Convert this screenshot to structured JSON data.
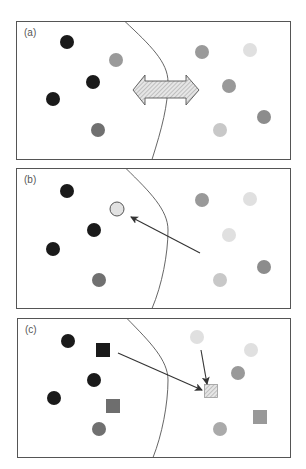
{
  "figure": {
    "panels": [
      {
        "label": "(a)",
        "description": "Two clusters separated by a curved decision boundary; a double-headed hatched arrow crosses the boundary",
        "points": [
          {
            "shape": "circle",
            "x": 67,
            "y": 42,
            "color": "#1a1a1a"
          },
          {
            "shape": "circle",
            "x": 116,
            "y": 60,
            "color": "#9a9a9a"
          },
          {
            "shape": "circle",
            "x": 93,
            "y": 82,
            "color": "#1a1a1a"
          },
          {
            "shape": "circle",
            "x": 53,
            "y": 99,
            "color": "#1a1a1a"
          },
          {
            "shape": "circle",
            "x": 98,
            "y": 130,
            "color": "#707070"
          },
          {
            "shape": "circle",
            "x": 202,
            "y": 52,
            "color": "#9a9a9a"
          },
          {
            "shape": "circle",
            "x": 250,
            "y": 50,
            "color": "#e0e0e0"
          },
          {
            "shape": "circle",
            "x": 229,
            "y": 86,
            "color": "#999999"
          },
          {
            "shape": "circle",
            "x": 264,
            "y": 117,
            "color": "#8c8c8c"
          },
          {
            "shape": "circle",
            "x": 220,
            "y": 130,
            "color": "#c8c8c8"
          }
        ]
      },
      {
        "label": "(b)",
        "description": "A point from the right cluster is moved across the boundary (arrow) to an outlined light circle",
        "points": [
          {
            "shape": "circle",
            "x": 67,
            "y": 191,
            "color": "#1a1a1a"
          },
          {
            "shape": "circle-outlined",
            "x": 117,
            "y": 209,
            "color": "#e2e2e2"
          },
          {
            "shape": "circle",
            "x": 94,
            "y": 230,
            "color": "#1a1a1a"
          },
          {
            "shape": "circle",
            "x": 53,
            "y": 249,
            "color": "#1a1a1a"
          },
          {
            "shape": "circle",
            "x": 99,
            "y": 280,
            "color": "#707070"
          },
          {
            "shape": "circle",
            "x": 202,
            "y": 200,
            "color": "#999999"
          },
          {
            "shape": "circle",
            "x": 250,
            "y": 199,
            "color": "#e0e0e0"
          },
          {
            "shape": "circle",
            "x": 229,
            "y": 235,
            "color": "#e0e0e0"
          },
          {
            "shape": "circle",
            "x": 264,
            "y": 267,
            "color": "#8c8c8c"
          },
          {
            "shape": "circle",
            "x": 220,
            "y": 280,
            "color": "#c8c8c8"
          }
        ]
      },
      {
        "label": "(c)",
        "description": "Squares are combined via two arrows into a hatched square on the right side",
        "points": [
          {
            "shape": "circle",
            "x": 68,
            "y": 341,
            "color": "#1a1a1a"
          },
          {
            "shape": "square",
            "x": 103,
            "y": 350,
            "color": "#1a1a1a"
          },
          {
            "shape": "circle",
            "x": 94,
            "y": 380,
            "color": "#1a1a1a"
          },
          {
            "shape": "circle",
            "x": 54,
            "y": 398,
            "color": "#1a1a1a"
          },
          {
            "shape": "square",
            "x": 113,
            "y": 406,
            "color": "#6e6e6e"
          },
          {
            "shape": "circle",
            "x": 99,
            "y": 429,
            "color": "#707070"
          },
          {
            "shape": "circle",
            "x": 197,
            "y": 337,
            "color": "#e0e0e0"
          },
          {
            "shape": "circle",
            "x": 251,
            "y": 350,
            "color": "#e0e0e0"
          },
          {
            "shape": "circle",
            "x": 238,
            "y": 373,
            "color": "#999999"
          },
          {
            "shape": "square-hatched",
            "x": 211,
            "y": 391,
            "color": "#e8e8e8"
          },
          {
            "shape": "square",
            "x": 260,
            "y": 417,
            "color": "#999999"
          },
          {
            "shape": "circle",
            "x": 220,
            "y": 429,
            "color": "#aaaaaa"
          }
        ]
      }
    ],
    "colors": {
      "frame": "#555555",
      "boundary": "#555555",
      "arrow": "#333333",
      "hatch_fill": "#e6e6e6",
      "hatch_line": "#999999"
    }
  }
}
